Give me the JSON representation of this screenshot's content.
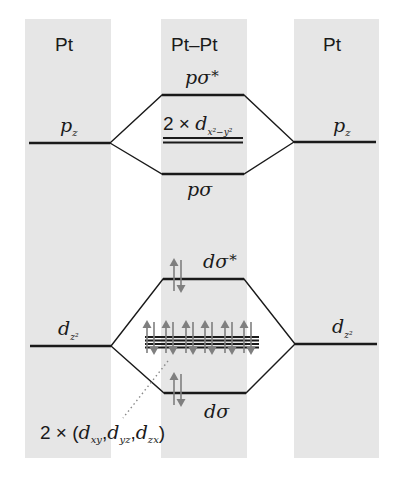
{
  "columns": [
    {
      "id": "left",
      "label": "Pt",
      "shade_color": "#e6e6e6"
    },
    {
      "id": "center",
      "label": "Pt–Pt",
      "shade_color": "#e6e6e6"
    },
    {
      "id": "right",
      "label": "Pt",
      "shade_color": "#e6e6e6"
    }
  ],
  "levels": {
    "p_sigma_star": {
      "main": "pσ",
      "star": "*"
    },
    "pz_left": {
      "main": "p",
      "sub": "z"
    },
    "pz_right": {
      "main": "p",
      "sub": "z"
    },
    "dx2y2": {
      "prefix": "2 × ",
      "main": "d",
      "sub": "x²−y²"
    },
    "p_sigma": {
      "main": "pσ"
    },
    "d_sigma_star": {
      "main": "dσ",
      "star": "*"
    },
    "dz2_left": {
      "main": "d",
      "sub": "z²"
    },
    "dz2_right": {
      "main": "d",
      "sub": "z²"
    },
    "d_sigma": {
      "main": "dσ"
    },
    "nonbonding_d": {
      "prefix": "2 × (",
      "d1": "d",
      "s1": "xy",
      "sep1": ",",
      "d2": "d",
      "s2": "yz",
      "sep2": ",",
      "d3": "d",
      "s3": "zx",
      "suffix": ")"
    }
  },
  "electron_pairs": {
    "d_sigma_star": 1,
    "nonbonding_stack": 6,
    "d_sigma": 1
  },
  "colors": {
    "line": "#1a1a1a",
    "arrow": "#7f7f7f",
    "column_shade": "#e6e6e6",
    "leader_dots": "#8a8a8a"
  }
}
